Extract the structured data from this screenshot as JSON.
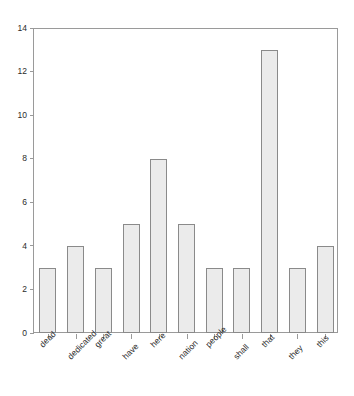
{
  "chart_data": {
    "type": "bar",
    "title": "",
    "subtitle": "",
    "xlabel": "",
    "ylabel": "",
    "categories": [
      "dead",
      "dedicated",
      "great",
      "have",
      "here",
      "nation",
      "people",
      "shall",
      "that",
      "they",
      "this"
    ],
    "values": [
      3,
      4,
      3,
      5,
      8,
      5,
      3,
      3,
      13,
      3,
      4
    ],
    "ylim": [
      0,
      14
    ],
    "y_ticks": [
      0,
      2,
      4,
      6,
      8,
      10,
      12,
      14
    ],
    "y_tick_labels": [
      "0",
      "2",
      "4",
      "6",
      "8",
      "10",
      "12",
      "14"
    ],
    "grid": false,
    "legend": null,
    "legend_position": "none",
    "annotations": [],
    "bar_fill_color": "#ebebeb",
    "bar_border_color": "#8a8a8a",
    "axis_color": "#9a9a9a",
    "plot_background": "#ffffff",
    "text_color": "#2b2b2b",
    "x_label_rotation": -45
  }
}
